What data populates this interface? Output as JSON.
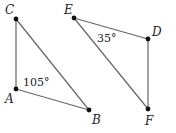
{
  "diagram": {
    "title": "",
    "triangles": [
      {
        "name": "ABC",
        "vertices": [
          {
            "id": "C",
            "label": "C",
            "x": 16,
            "y": 19,
            "lx": 5,
            "ly": 14
          },
          {
            "id": "A",
            "label": "A",
            "x": 16,
            "y": 89,
            "lx": 5,
            "ly": 103
          },
          {
            "id": "B",
            "label": "B",
            "x": 89,
            "y": 110,
            "lx": 92,
            "ly": 124
          }
        ],
        "angle": {
          "vertex": "A",
          "text": "105°",
          "x": 23,
          "y": 86
        }
      },
      {
        "name": "DEF",
        "vertices": [
          {
            "id": "E",
            "label": "E",
            "x": 74,
            "y": 18,
            "lx": 64,
            "ly": 14
          },
          {
            "id": "D",
            "label": "D",
            "x": 148,
            "y": 39,
            "lx": 152,
            "ly": 36
          },
          {
            "id": "F",
            "label": "F",
            "x": 148,
            "y": 109,
            "lx": 145,
            "ly": 125
          }
        ],
        "angle": {
          "vertex": "E",
          "text": "35°",
          "x": 97,
          "y": 42
        }
      }
    ],
    "colors": {
      "edge": "#666666",
      "point": "#111111",
      "text": "#222222"
    }
  }
}
